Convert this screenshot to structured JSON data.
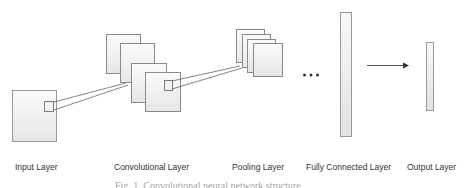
{
  "diagram": {
    "layers": [
      {
        "id": "input",
        "label": "Input Layer"
      },
      {
        "id": "conv",
        "label": "Convolutional  Layer"
      },
      {
        "id": "pool",
        "label": "Pooling  Layer"
      },
      {
        "id": "fc",
        "label": "Fully Connected Layer"
      },
      {
        "id": "output",
        "label": "Output Layer"
      }
    ],
    "ellipsis": "...",
    "caption": "Fig. 1. Convolutional neural network structure"
  },
  "colors": {
    "stroke": "#8a8a8a",
    "fill_light": "#f6f6f6",
    "fill_dark": "#e4e4e4",
    "line": "#555555",
    "text": "#333333"
  }
}
